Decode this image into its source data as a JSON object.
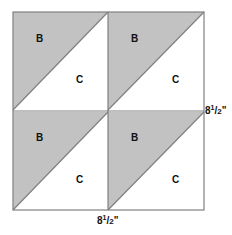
{
  "diagram": {
    "grid": {
      "rows": 2,
      "cols": 2,
      "x": 13,
      "y": 12,
      "size": 191
    },
    "colors": {
      "shaded": "#c2c2c2",
      "light": "#ffffff",
      "line": "#808080"
    },
    "blocks": [
      {
        "shaded_label": "B",
        "light_label": "C"
      },
      {
        "shaded_label": "B",
        "light_label": "C"
      },
      {
        "shaded_label": "B",
        "light_label": "C"
      },
      {
        "shaded_label": "B",
        "light_label": "C"
      }
    ],
    "dimensions": {
      "right": {
        "whole": "8",
        "num": "1",
        "den": "2",
        "unit": "\""
      },
      "bottom": {
        "whole": "8",
        "num": "1",
        "den": "2",
        "unit": "\""
      }
    }
  }
}
